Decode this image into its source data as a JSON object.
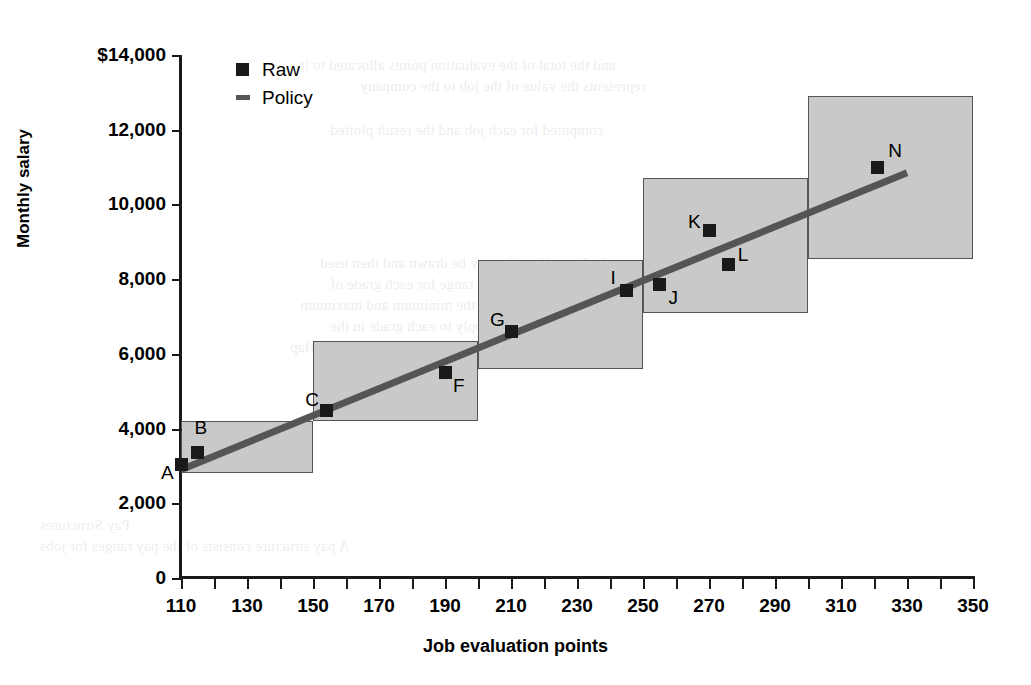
{
  "chart_data": {
    "type": "scatter",
    "title": "",
    "xlabel": "Job evaluation points",
    "ylabel": "Monthly salary",
    "xlim": [
      110,
      350
    ],
    "ylim": [
      0,
      14000
    ],
    "grid": false,
    "legend_position": "top-left-inside",
    "legend": [
      {
        "label": "Raw",
        "marker": "square",
        "color": "#1a1a1a"
      },
      {
        "label": "Policy",
        "marker": "line",
        "color": "#555555"
      }
    ],
    "x_ticks": [
      110,
      120,
      130,
      140,
      150,
      160,
      170,
      180,
      190,
      200,
      210,
      220,
      230,
      240,
      250,
      260,
      270,
      280,
      290,
      300,
      310,
      320,
      330,
      340,
      350
    ],
    "x_tick_labels": [
      "110",
      "",
      "130",
      "",
      "150",
      "",
      "170",
      "",
      "190",
      "",
      "210",
      "",
      "230",
      "",
      "250",
      "",
      "270",
      "",
      "290",
      "",
      "310",
      "",
      "330",
      "",
      "350"
    ],
    "y_ticks": [
      0,
      2000,
      4000,
      6000,
      8000,
      10000,
      12000,
      14000
    ],
    "y_tick_labels": [
      "0",
      "2,000",
      "4,000",
      "6,000",
      "8,000",
      "10,000",
      "12,000",
      "$14,000"
    ],
    "points": [
      {
        "label": "A",
        "x": 110,
        "y": 3050,
        "label_dx": -20,
        "label_dy": 8
      },
      {
        "label": "B",
        "x": 115,
        "y": 3350,
        "label_dx": -3,
        "label_dy": -26
      },
      {
        "label": "C",
        "x": 154,
        "y": 4480,
        "label_dx": -21,
        "label_dy": -12
      },
      {
        "label": "F",
        "x": 190,
        "y": 5500,
        "label_dx": 8,
        "label_dy": 12
      },
      {
        "label": "G",
        "x": 210,
        "y": 6600,
        "label_dx": -21,
        "label_dy": -12
      },
      {
        "label": "I",
        "x": 245,
        "y": 7700,
        "label_dx": -16,
        "label_dy": -13
      },
      {
        "label": "J",
        "x": 255,
        "y": 7850,
        "label_dx": 9,
        "label_dy": 12
      },
      {
        "label": "K",
        "x": 270,
        "y": 9300,
        "label_dx": -21,
        "label_dy": -10
      },
      {
        "label": "L",
        "x": 276,
        "y": 8400,
        "label_dx": 9,
        "label_dy": -10
      },
      {
        "label": "N",
        "x": 321,
        "y": 11000,
        "label_dx": 11,
        "label_dy": -17
      }
    ],
    "policy_line": {
      "x1": 110,
      "y1": 2900,
      "x2": 330,
      "y2": 10850,
      "color": "#555555",
      "width": 7
    },
    "grade_boxes": [
      {
        "x1": 110,
        "x2": 150,
        "ymin": 2800,
        "ymax": 4200
      },
      {
        "x1": 150,
        "x2": 200,
        "ymin": 4200,
        "ymax": 6350
      },
      {
        "x1": 200,
        "x2": 250,
        "ymin": 5600,
        "ymax": 8500
      },
      {
        "x1": 250,
        "x2": 300,
        "ymin": 7100,
        "ymax": 10700
      },
      {
        "x1": 300,
        "x2": 350,
        "ymin": 8550,
        "ymax": 12900
      }
    ],
    "colors": {
      "marker": "#1a1a1a",
      "policy_line": "#555555",
      "box_fill": "#c9c9c9",
      "box_border": "#555555",
      "axis": "#1a1a1a",
      "text": "#000000"
    }
  },
  "background_text": {
    "lines": [
      "and the total of the evaluation points allocated to it",
      "represents the value of the job to the company",
      "",
      "computed for each job and the result plotted",
      "",
      "the line of best fit may be drawn and then used",
      "to determine the salary range for each grade of",
      "work. The boxes show the minimum and maximum",
      "rates of pay which apply to each grade in the",
      "structure, and the extent to which the rates overlap",
      "",
      "Pay Structures",
      "A pay structure consists of the pay ranges for jobs"
    ]
  }
}
